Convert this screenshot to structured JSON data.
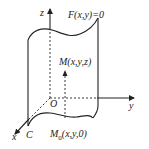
{
  "diagram": {
    "colors": {
      "stroke": "#222222",
      "background": "#ffffff"
    },
    "labels": {
      "z_axis": "z",
      "y_axis": "y",
      "x_axis": "x",
      "origin": "O",
      "surface_equation": "F(x,y)=0",
      "point_M": "M(x,y,z)",
      "point_M0": "M0(x,y,0)",
      "point_M0_base": "M",
      "point_M0_sub": "0",
      "point_M0_rest": "(x,y,0)",
      "directrix": "C"
    }
  }
}
